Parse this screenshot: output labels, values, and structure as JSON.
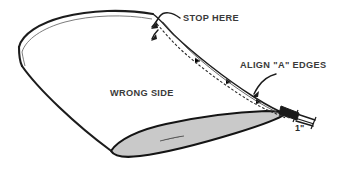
{
  "diagram": {
    "type": "line-art-illustration",
    "background_color": "#ffffff",
    "ink_color": "#1c1c1c",
    "shaded_fill_color": "#c9c9c9",
    "annotations": [
      {
        "id": "stop-here",
        "text": "STOP HERE",
        "x": 183,
        "y": 21,
        "leader": "curved-arrow-pointing-down-left"
      },
      {
        "id": "align-a-edges",
        "text": "ALIGN \"A\" EDGES",
        "x": 240,
        "y": 68,
        "leader": "curved-arrow-pointing-down-left"
      },
      {
        "id": "wrong-side",
        "text": "WRONG SIDE",
        "x": 110,
        "y": 96,
        "leader": "none"
      },
      {
        "id": "one-inch-dimension",
        "text": "1\"",
        "x": 295,
        "y": 127,
        "leader": "dimension-tick"
      }
    ],
    "features": {
      "seam_label": "dashed stitching line",
      "flap_label": "shaded folded-back flap",
      "hem_label": "double-line folded hem edge",
      "tip_label": "dark aligned edge tip"
    }
  }
}
